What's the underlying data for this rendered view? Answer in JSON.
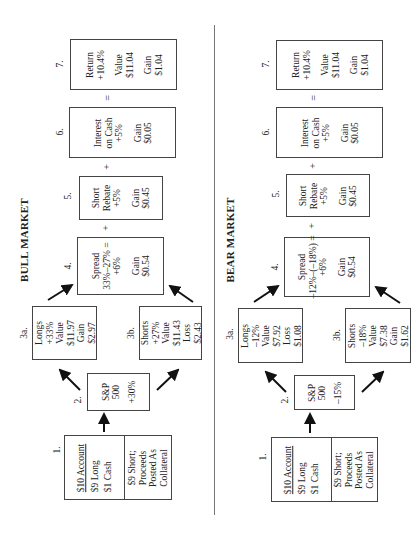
{
  "bull": {
    "title": "BULL MARKET",
    "step1": {
      "label": "1.",
      "account": "$10  Account",
      "long": "$9  Long",
      "cash": "$1  Cash",
      "short_l1": "$9 Short;",
      "short_l2": "Proceeds",
      "short_l3": "Posted As",
      "short_l4": "Collateral"
    },
    "step2": {
      "label": "2.",
      "l1": "S&P",
      "l2": "500",
      "change": "+30%"
    },
    "step3a": {
      "label": "3a.",
      "l1": "Longs",
      "l2": "+33%",
      "l3": "Value",
      "l4": "$11.97",
      "l5": "Gain",
      "l6": "$2.97"
    },
    "step3b": {
      "label": "3b.",
      "l1": "Shorts",
      "l2": "+27%",
      "l3": "Value",
      "l4": "$11.43",
      "l5": "Loss",
      "l6": "$2.43"
    },
    "step4": {
      "label": "4.",
      "l1": "Spread",
      "l2": "33%–27% =",
      "l3": "+6%",
      "l4": "Gain",
      "l5": "$0.54"
    },
    "step5": {
      "label": "5.",
      "l1": "Short",
      "l2": "Rebate",
      "l3": "+5%",
      "l4": "Gain",
      "l5": "$0.45"
    },
    "step6": {
      "label": "6.",
      "l1": "Interest",
      "l2": "on Cash",
      "l3": "+5%",
      "l4": "Gain",
      "l5": "$0.05"
    },
    "step7": {
      "label": "7.",
      "l1": "Return",
      "l2": "+10.4%",
      "l3": "Value",
      "l4": "$11.04",
      "l5": "Gain",
      "l6": "$1.04"
    },
    "ops": {
      "plus1": "+",
      "plus2": "+",
      "equals": "="
    }
  },
  "bear": {
    "title": "BEAR MARKET",
    "step1": {
      "label": "1.",
      "account": "$10  Account",
      "long": "$9  Long",
      "cash": "$1  Cash",
      "short_l1": "$9 Short;",
      "short_l2": "Proceeds",
      "short_l3": "Posted As",
      "short_l4": "Collateral"
    },
    "step2": {
      "label": "2.",
      "l1": "S&P",
      "l2": "500",
      "change": "–15%"
    },
    "step3a": {
      "label": "3a.",
      "l1": "Longs",
      "l2": "–12%",
      "l3": "Value",
      "l4": "$7.92",
      "l5": "Loss",
      "l6": "$1.08"
    },
    "step3b": {
      "label": "3b.",
      "l1": "Shorts",
      "l2": "–18%",
      "l3": "Value",
      "l4": "$7.38",
      "l5": "Gain",
      "l6": "$1.62"
    },
    "step4": {
      "label": "4.",
      "l1": "Spread",
      "l2": "–12%–(–18%) =",
      "l3": "+6%",
      "l4": "Gain",
      "l5": "$0.54"
    },
    "step5": {
      "label": "5.",
      "l1": "Short",
      "l2": "Rebate",
      "l3": "+5%",
      "l4": "Gain",
      "l5": "$0.45"
    },
    "step6": {
      "label": "6.",
      "l1": "Interest",
      "l2": "on Cash",
      "l3": "+5%",
      "l4": "Gain",
      "l5": "$0.05"
    },
    "step7": {
      "label": "7.",
      "l1": "Return",
      "l2": "+10.4%",
      "l3": "Value",
      "l4": "$11.04",
      "l5": "Gain",
      "l6": "$1.04"
    },
    "ops": {
      "plus1": "+",
      "plus2": "+",
      "equals": "="
    }
  }
}
